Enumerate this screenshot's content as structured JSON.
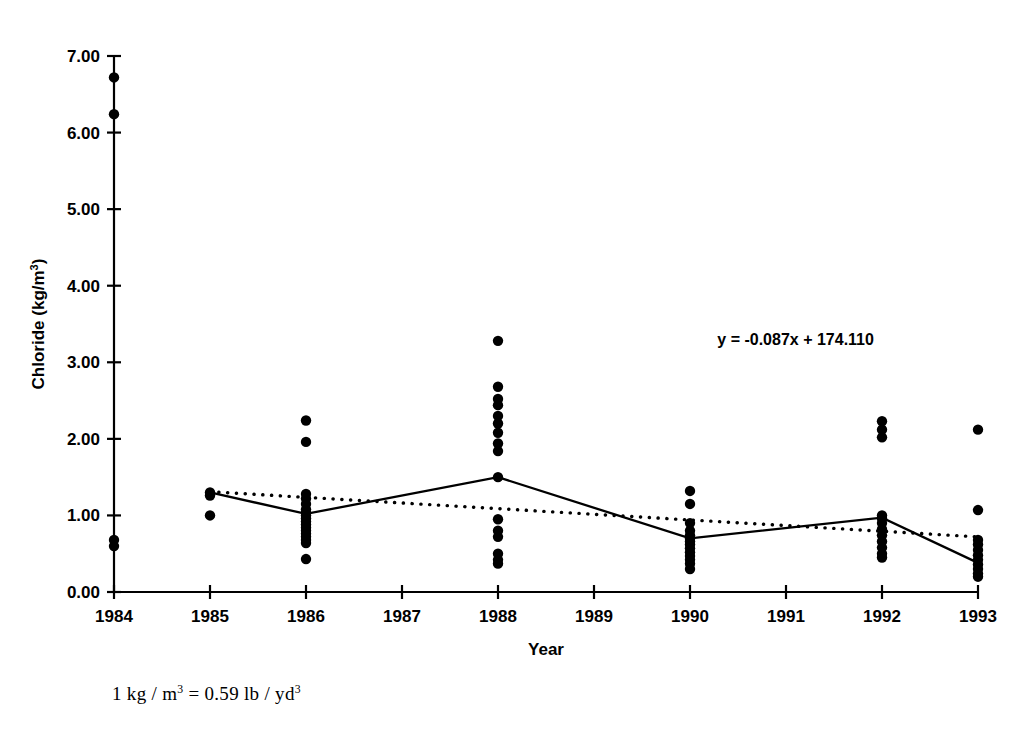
{
  "chart_data": {
    "type": "scatter",
    "title": "",
    "xlabel": "Year",
    "ylabel": "Chloride (kg/m³)",
    "ylabel_base": "Chloride (kg/m",
    "ylabel_sup": "3",
    "ylabel_close": ")",
    "xlim": [
      1984,
      1993
    ],
    "ylim": [
      0.0,
      7.0
    ],
    "grid": false,
    "legend": null,
    "xticks": [
      1984,
      1985,
      1986,
      1987,
      1988,
      1989,
      1990,
      1991,
      1992,
      1993
    ],
    "xticklabels": [
      "1984",
      "1985",
      "1986",
      "1987",
      "1988",
      "1989",
      "1990",
      "1991",
      "1992",
      "1993"
    ],
    "yticks": [
      0.0,
      1.0,
      2.0,
      3.0,
      4.0,
      5.0,
      6.0,
      7.0
    ],
    "yticklabels": [
      "0.00",
      "1.00",
      "2.00",
      "3.00",
      "4.00",
      "5.00",
      "6.00",
      "7.00"
    ],
    "annotations": [
      {
        "name": "regression-equation",
        "text": "y = -0.087x + 174.110",
        "x": 1991.1,
        "y": 3.22
      }
    ],
    "footnote": "1 kg / m³ = 0.59 lb / yd³",
    "footnote_parts": {
      "a": "1 kg / m",
      "sup1": "3",
      "b": " = 0.59 lb / yd",
      "sup2": "3"
    },
    "scatter_points": [
      {
        "x": 1984,
        "values": [
          6.72,
          6.24,
          0.68,
          0.6
        ]
      },
      {
        "x": 1985,
        "values": [
          1.3,
          1.26,
          1.0
        ]
      },
      {
        "x": 1986,
        "values": [
          2.24,
          1.96,
          1.28,
          1.22,
          1.15,
          1.08,
          1.04,
          1.0,
          0.96,
          0.92,
          0.88,
          0.84,
          0.8,
          0.76,
          0.72,
          0.68,
          0.64,
          0.43
        ]
      },
      {
        "x": 1988,
        "values": [
          3.28,
          2.68,
          2.52,
          2.44,
          2.3,
          2.2,
          2.08,
          1.94,
          1.84,
          1.5,
          0.95,
          0.8,
          0.72,
          0.5,
          0.42,
          0.37
        ]
      },
      {
        "x": 1990,
        "values": [
          1.32,
          1.15,
          0.9,
          0.8,
          0.74,
          0.7,
          0.66,
          0.62,
          0.57,
          0.52,
          0.47,
          0.42,
          0.37,
          0.3
        ]
      },
      {
        "x": 1992,
        "values": [
          2.23,
          2.12,
          2.02,
          1.0,
          0.96,
          0.9,
          0.82,
          0.74,
          0.66,
          0.58,
          0.5,
          0.45
        ]
      },
      {
        "x": 1993,
        "values": [
          2.12,
          1.07,
          0.68,
          0.62,
          0.55,
          0.48,
          0.42,
          0.36,
          0.3,
          0.24,
          0.2
        ]
      }
    ],
    "series": [
      {
        "name": "annual-mean-line",
        "style": "solid",
        "x": [
          1985,
          1986,
          1988,
          1990,
          1992,
          1993
        ],
        "values": [
          1.3,
          1.02,
          1.5,
          0.7,
          0.97,
          0.38
        ]
      },
      {
        "name": "linear-trend-line",
        "style": "dotted",
        "x": [
          1985,
          1993
        ],
        "values": [
          1.31,
          0.72
        ]
      }
    ]
  }
}
